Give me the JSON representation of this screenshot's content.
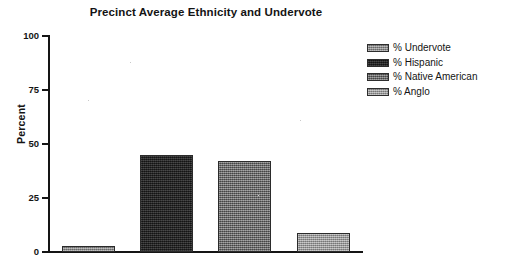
{
  "chart_data": {
    "type": "bar",
    "title": "Precinct Average Ethnicity and Undervote",
    "xlabel": "",
    "ylabel": "Percent",
    "ylim": [
      0,
      100
    ],
    "yticks": [
      0,
      25,
      50,
      75,
      100
    ],
    "ytick_labels": [
      "0",
      "25",
      "50",
      "75",
      "100"
    ],
    "grid": false,
    "legend_position": "right",
    "categories": [
      "% Undervote",
      "% Hispanic",
      "% Native American",
      "% Anglo"
    ],
    "values": [
      3,
      45,
      42,
      9
    ],
    "bars": [
      {
        "label": "% Undervote",
        "value": 3,
        "color": "#8e8e8e",
        "texture": "tex-undervote"
      },
      {
        "label": "% Hispanic",
        "value": 45,
        "color": "#242424",
        "texture": "tex-hispanic"
      },
      {
        "label": "% Native American",
        "value": 42,
        "color": "#6f6f6f",
        "texture": "tex-native"
      },
      {
        "label": "% Anglo",
        "value": 9,
        "color": "#9a9a9a",
        "texture": "tex-anglo"
      }
    ],
    "legend": [
      {
        "label": "% Undervote",
        "color": "#8e8e8e",
        "texture": "tex-undervote"
      },
      {
        "label": "% Hispanic",
        "color": "#242424",
        "texture": "tex-hispanic"
      },
      {
        "label": "% Native American",
        "color": "#6f6f6f",
        "texture": "tex-native"
      },
      {
        "label": "% Anglo",
        "color": "#9a9a9a",
        "texture": "tex-anglo"
      }
    ],
    "axis_color": "#151515",
    "background_color": "#ffffff"
  }
}
